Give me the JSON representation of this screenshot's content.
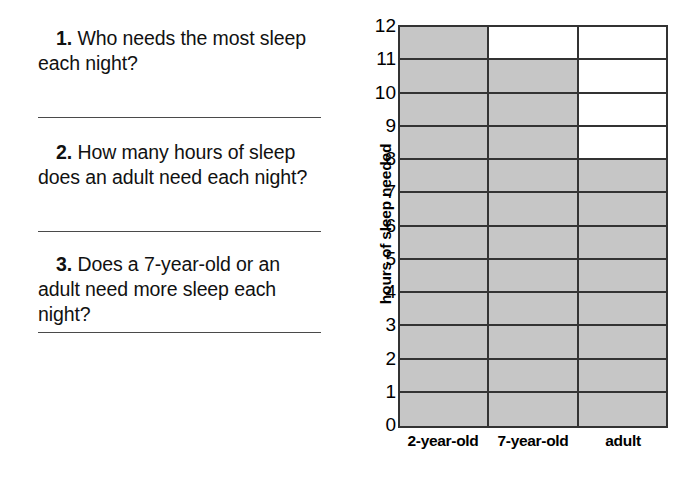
{
  "worksheet": {
    "questions": [
      {
        "number": "1.",
        "text": "Who needs the most sleep each night?"
      },
      {
        "number": "2.",
        "text": "How many hours of sleep does an adult need each night?"
      },
      {
        "number": "3.",
        "text": "Does a 7-year-old or an adult need more sleep each night?"
      }
    ]
  },
  "chart_data": {
    "type": "bar",
    "title": "",
    "xlabel": "",
    "ylabel": "hours of sleep needed",
    "categories": [
      "2-year-old",
      "7-year-old",
      "adult"
    ],
    "values": [
      12,
      11,
      8
    ],
    "ylim": [
      0,
      12
    ],
    "ytick_labels": [
      "12",
      "11",
      "10",
      "9",
      "8",
      "7",
      "6",
      "5",
      "4",
      "3",
      "2",
      "1",
      "0"
    ],
    "grid": true,
    "legend": "none",
    "bar_fill_color": "#c6c6c6",
    "bar_border_color": "#333333",
    "background_color": "#ffffff"
  }
}
